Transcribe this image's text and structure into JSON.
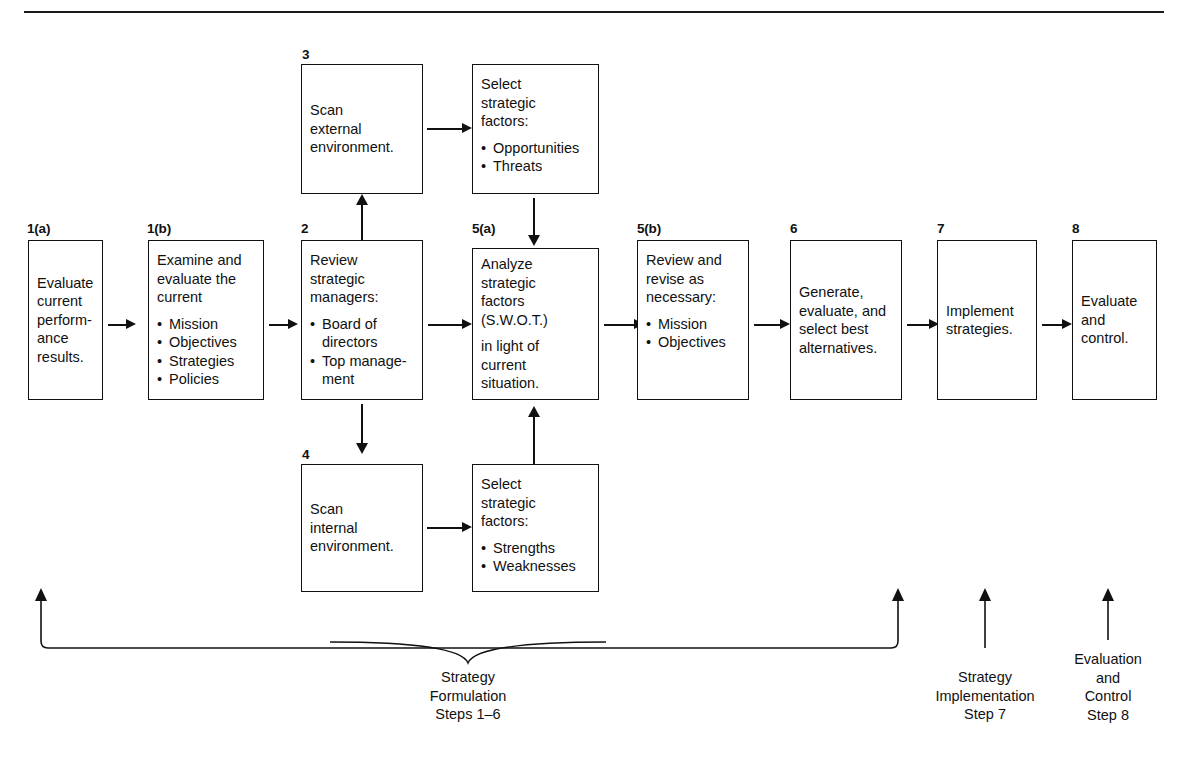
{
  "diagram": {
    "title_rule": true,
    "boxes": [
      {
        "id": "1a",
        "step": "1(a)",
        "text": "Evaluate\ncurrent\nperform-\nance\nresults.",
        "bullets": []
      },
      {
        "id": "1b",
        "step": "1(b)",
        "text": "Examine and\nevaluate the\ncurrent",
        "bullets": [
          "Mission",
          "Objectives",
          "Strategies",
          "Policies"
        ]
      },
      {
        "id": "2",
        "step": "2",
        "text": "Review\nstrategic\nmanagers:",
        "bullets": [
          "Board of\ndirectors",
          "Top manage-\nment"
        ]
      },
      {
        "id": "3",
        "step": "3",
        "text": "Scan\nexternal\nenvironment.",
        "bullets": []
      },
      {
        "id": "sel-ext",
        "step": "",
        "text": "Select\nstrategic\nfactors:",
        "bullets": [
          "Opportunities",
          "Threats"
        ]
      },
      {
        "id": "4",
        "step": "4",
        "text": "Scan\ninternal\nenvironment.",
        "bullets": []
      },
      {
        "id": "sel-int",
        "step": "",
        "text": "Select\nstrategic\nfactors:",
        "bullets": [
          "Strengths",
          "Weaknesses"
        ]
      },
      {
        "id": "5a",
        "step": "5(a)",
        "text": "Analyze\nstrategic\nfactors\n(S.W.O.T.)",
        "text2": "in light of\ncurrent\nsituation.",
        "bullets": []
      },
      {
        "id": "5b",
        "step": "5(b)",
        "text": "Review and\nrevise as\nnecessary:",
        "bullets": [
          "Mission",
          "Objectives"
        ]
      },
      {
        "id": "6",
        "step": "6",
        "text": "Generate,\nevaluate, and\nselect best\nalternatives.",
        "bullets": []
      },
      {
        "id": "7",
        "step": "7",
        "text": "Implement\nstrategies.",
        "bullets": []
      },
      {
        "id": "8",
        "step": "8",
        "text": "Evaluate\nand\ncontrol.",
        "bullets": []
      }
    ],
    "captions": [
      {
        "id": "formulation",
        "text": "Strategy\nFormulation\nSteps 1–6"
      },
      {
        "id": "implementation",
        "text": "Strategy\nImplementation\nStep 7"
      },
      {
        "id": "evaluation",
        "text": "Evaluation\nand\nControl\nStep 8"
      }
    ],
    "colors": {
      "ink": "#111111",
      "paper": "#ffffff"
    }
  }
}
